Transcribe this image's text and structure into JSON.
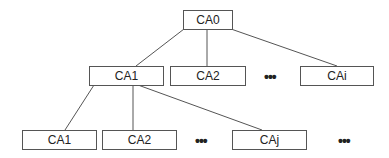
{
  "diagram": {
    "type": "tree",
    "root": {
      "label": "CA0"
    },
    "level1": [
      {
        "label": "CA1"
      },
      {
        "label": "CA2"
      },
      {
        "label": "•••"
      },
      {
        "label": "CAi"
      }
    ],
    "level2": [
      {
        "label": "CA1"
      },
      {
        "label": "CA2"
      },
      {
        "label": "•••"
      },
      {
        "label": "CAj"
      },
      {
        "label": "•••"
      }
    ],
    "edges": [
      [
        "CA0",
        "CA1"
      ],
      [
        "CA0",
        "CA2"
      ],
      [
        "CA0",
        "CAi"
      ],
      [
        "CA1",
        "CA1 (level 2)"
      ],
      [
        "CA1",
        "CA2 (level 2)"
      ],
      [
        "CA1",
        "CAj"
      ]
    ],
    "colors": {
      "line": "#555555",
      "box_border": "#555555",
      "text": "#222222"
    }
  }
}
